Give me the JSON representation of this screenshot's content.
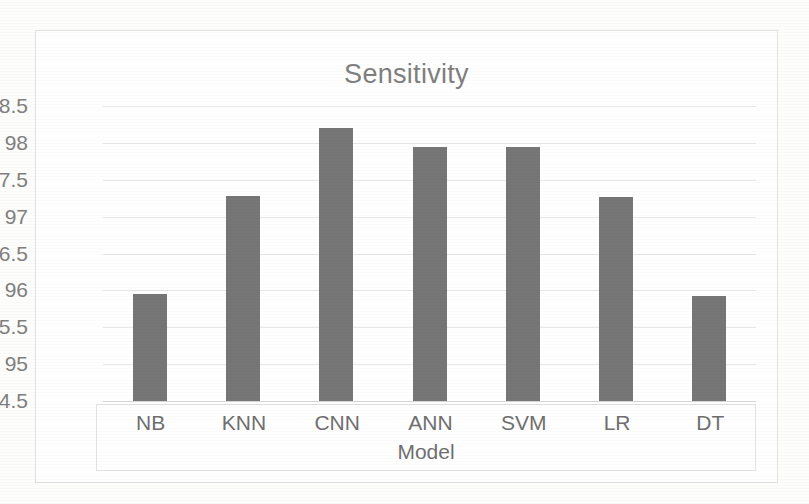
{
  "chart_data": {
    "type": "bar",
    "title": "Sensitivity",
    "xlabel": "Model",
    "ylabel": "",
    "categories": [
      "NB",
      "KNN",
      "CNN",
      "ANN",
      "SVM",
      "LR",
      "DT"
    ],
    "values": [
      95.95,
      97.28,
      98.2,
      97.95,
      97.95,
      97.27,
      95.92
    ],
    "series": [
      {
        "name": "Sensitivity",
        "values": [
          95.95,
          97.28,
          98.2,
          97.95,
          97.95,
          97.27,
          95.92
        ]
      }
    ],
    "ylim": [
      94.5,
      98.5
    ],
    "ytick_step": 0.5,
    "ytick_labels": [
      "98.5",
      "98",
      "97.5",
      "97",
      "96.5",
      "96",
      "95.5",
      "95",
      "94.5"
    ],
    "ytick_values": [
      98.5,
      98,
      97.5,
      97,
      96.5,
      96,
      95.5,
      95,
      94.5
    ],
    "grid": true,
    "grid_axis": "y",
    "legend": false,
    "legend_position": "none",
    "bar_color": "#767676",
    "title_color": "#7f7f7f",
    "tick_label_color": "#808080",
    "gridline_color": "#e8e8e8",
    "frame_color": "#e3e3e3",
    "background_color": "#ffffff"
  }
}
